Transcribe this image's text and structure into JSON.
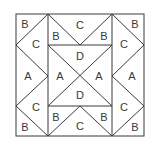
{
  "diagram": {
    "line_color": "#3a3a3a",
    "background": "#ffffff",
    "labels": {
      "tl_b": "B",
      "tl_c": "C",
      "top_b_left": "B",
      "top_c": "C",
      "top_b_right": "B",
      "tr_b": "B",
      "tr_c": "C",
      "left_a": "A",
      "right_a": "A",
      "center_d_top": "D",
      "center_a_left": "A",
      "center_a_right": "A",
      "center_d_bottom": "D",
      "bl_c": "C",
      "bl_b": "B",
      "bottom_b_left": "B",
      "bottom_c": "C",
      "bottom_b_right": "B",
      "br_c": "C",
      "br_b": "B"
    }
  }
}
